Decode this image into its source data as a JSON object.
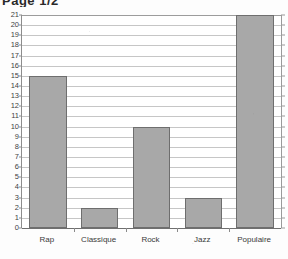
{
  "header": {
    "title": "Page 1/2"
  },
  "chart_data": {
    "type": "bar",
    "title": "",
    "xlabel": "",
    "ylabel": "",
    "categories": [
      "Rap",
      "Classique",
      "Rock",
      "Jazz",
      "Populaire"
    ],
    "values": [
      15,
      2,
      10,
      3,
      21
    ],
    "ylim": [
      0,
      21
    ],
    "ytick_labels": [
      "0",
      "1",
      "2",
      "3",
      "4",
      "5",
      "6",
      "7",
      "8",
      "9",
      "10",
      "11",
      "12",
      "13",
      "14",
      "15",
      "16",
      "17",
      "18",
      "19",
      "20",
      "21"
    ],
    "ytick_step": 1,
    "grid": true,
    "legend": null,
    "bar_color": "#a8a8a8",
    "bar_border_color": "#6e6e6e",
    "gridline_color": "#c6c6c6",
    "axis_color": "#6f6f6f",
    "background": "#ffffff"
  }
}
